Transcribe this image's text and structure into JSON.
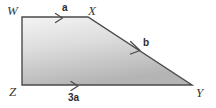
{
  "figure": {
    "type": "geometry-diagram",
    "shape": "trapezoid",
    "name": "trapezoid-WXYZ",
    "background_color": "#ffffff",
    "stroke_color": "#4a4a4a",
    "stroke_width": 1.4,
    "fill_gradient_start": "#f2f2f2",
    "fill_gradient_end": "#b8b8b8",
    "vertices": [
      {
        "label": "W",
        "x": 22,
        "y": 17
      },
      {
        "label": "X",
        "x": 88,
        "y": 17
      },
      {
        "label": "Y",
        "x": 192,
        "y": 85
      },
      {
        "label": "Z",
        "x": 22,
        "y": 85
      }
    ],
    "polygon_points": "22,17 88,17 192,85 22,85",
    "vertex_labels": {
      "W": "W",
      "X": "X",
      "Y": "Y",
      "Z": "Z"
    },
    "side_labels": {
      "top": "a",
      "diagonal": "b",
      "bottom": "3a"
    },
    "sides": [
      {
        "name": "WX",
        "label": "a",
        "from": "W",
        "to": "X",
        "marked": true,
        "arrow_tip_x": 62,
        "arrow_tip_y": 18,
        "arrow_angle": 0
      },
      {
        "name": "XY",
        "label": "b",
        "from": "X",
        "to": "Y",
        "marked": true,
        "arrow_tip_x": 140,
        "arrow_tip_y": 51,
        "arrow_angle": 33
      },
      {
        "name": "ZY",
        "label": "3a",
        "from": "Z",
        "to": "Y",
        "marked": true,
        "arrow_tip_x": 78,
        "arrow_tip_y": 86,
        "arrow_angle": 0
      },
      {
        "name": "WZ",
        "label": "",
        "from": "W",
        "to": "Z",
        "marked": false
      }
    ]
  }
}
